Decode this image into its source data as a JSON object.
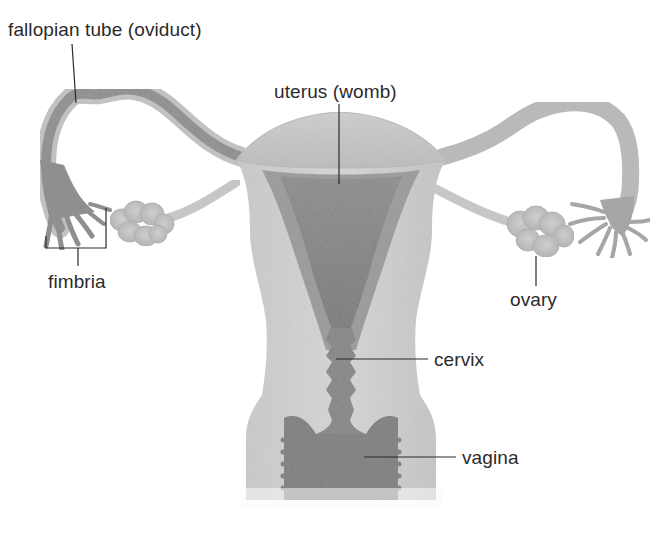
{
  "diagram": {
    "labels": {
      "fallopian_tube": "fallopian tube (oviduct)",
      "uterus": "uterus (womb)",
      "fimbria": "fimbria",
      "ovary": "ovary",
      "cervix": "cervix",
      "vagina": "vagina"
    },
    "colors": {
      "background": "#ffffff",
      "label_text": "#2b2b2b",
      "leader_line": "#2b2b2b",
      "tissue_outer": "#d4d4d4",
      "tissue_mid": "#bdbdbd",
      "tissue_dark": "#8f8f8f",
      "cavity": "#7d7d7d",
      "tube_dark": "#8a8a8a",
      "ovary_fill": "#c4c4c4"
    }
  }
}
